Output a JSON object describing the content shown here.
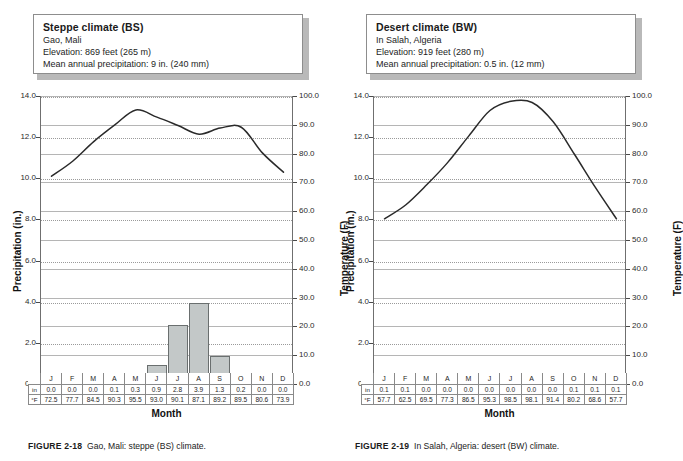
{
  "figures": [
    {
      "id": "gao-mali",
      "info": {
        "title": "Steppe climate (BS)",
        "location": "Gao, Mali",
        "elevation": "Elevation: 869 feet (265 m)",
        "precipitation": "Mean annual precipitation: 9 in. (240 mm)"
      },
      "caption_label": "FIGURE 2-18",
      "caption_text": "Gao, Mali: steppe (BS) climate.",
      "chart_data": {
        "type": "bar",
        "title": "Steppe climate (BS)",
        "categories": [
          "J",
          "F",
          "M",
          "A",
          "M",
          "J",
          "J",
          "A",
          "S",
          "O",
          "N",
          "D"
        ],
        "xlabel": "Month",
        "ylabel": "Precipitation (in.)",
        "ylabel_right": "Temperature (F)",
        "ylim": [
          0.0,
          14.0
        ],
        "ylim_right": [
          0.0,
          100.0
        ],
        "yticks": [
          "0.0",
          "2.0",
          "4.0",
          "6.0",
          "8.0",
          "10.0",
          "12.0",
          "14.0"
        ],
        "yticks_right": [
          "0.0",
          "10.0",
          "20.0",
          "30.0",
          "40.0",
          "50.0",
          "60.0",
          "70.0",
          "80.0",
          "90.0",
          "100.0"
        ],
        "grid": true,
        "legend": "none",
        "series": [
          {
            "name": "in",
            "type": "bar",
            "values": [
              0.0,
              0.0,
              0.0,
              0.1,
              0.3,
              0.9,
              2.8,
              3.9,
              1.3,
              0.2,
              0.0,
              0.0
            ]
          },
          {
            "name": "°F",
            "type": "line",
            "values": [
              72.5,
              77.7,
              84.5,
              90.3,
              95.5,
              93.0,
              90.1,
              87.1,
              89.2,
              89.5,
              80.6,
              73.9
            ]
          }
        ]
      },
      "table": {
        "row_labels": [
          "in",
          "°F"
        ],
        "months": [
          "J",
          "F",
          "M",
          "A",
          "M",
          "J",
          "J",
          "A",
          "S",
          "O",
          "N",
          "D"
        ],
        "precip": [
          "0.0",
          "0.0",
          "0.0",
          "0.1",
          "0.3",
          "0.9",
          "2.8",
          "3.9",
          "1.3",
          "0.2",
          "0.0",
          "0.0"
        ],
        "temp": [
          "72.5",
          "77.7",
          "84.5",
          "90.3",
          "95.5",
          "93.0",
          "90.1",
          "87.1",
          "89.2",
          "89.5",
          "80.6",
          "73.9"
        ]
      }
    },
    {
      "id": "in-salah-algeria",
      "info": {
        "title": "Desert climate (BW)",
        "location": "In Salah, Algeria",
        "elevation": "Elevation: 919 feet (280 m)",
        "precipitation": "Mean annual precipitation: 0.5 in. (12 mm)"
      },
      "caption_label": "FIGURE 2-19",
      "caption_text": "In Salah, Algeria: desert (BW) climate.",
      "chart_data": {
        "type": "bar",
        "title": "Desert climate (BW)",
        "categories": [
          "J",
          "F",
          "M",
          "A",
          "M",
          "J",
          "J",
          "A",
          "S",
          "O",
          "N",
          "D"
        ],
        "xlabel": "Month",
        "ylabel": "Precipitation (in.)",
        "ylabel_right": "Temperature (F)",
        "ylim": [
          0.0,
          14.0
        ],
        "ylim_right": [
          0.0,
          100.0
        ],
        "yticks": [
          "0.0",
          "2.0",
          "4.0",
          "6.0",
          "8.0",
          "10.0",
          "12.0",
          "14.0"
        ],
        "yticks_right": [
          "0.0",
          "10.0",
          "20.0",
          "30.0",
          "40.0",
          "50.0",
          "60.0",
          "70.0",
          "80.0",
          "90.0",
          "100.0"
        ],
        "grid": true,
        "legend": "none",
        "series": [
          {
            "name": "in",
            "type": "bar",
            "values": [
              0.1,
              0.1,
              0.0,
              0.0,
              0.0,
              0.0,
              0.0,
              0.0,
              0.0,
              0.1,
              0.1,
              0.1
            ]
          },
          {
            "name": "°F",
            "type": "line",
            "values": [
              57.7,
              62.5,
              69.5,
              77.3,
              86.5,
              95.3,
              98.5,
              98.1,
              91.4,
              80.2,
              68.6,
              57.7
            ]
          }
        ]
      },
      "table": {
        "row_labels": [
          "in",
          "°F"
        ],
        "months": [
          "J",
          "F",
          "M",
          "A",
          "M",
          "J",
          "J",
          "A",
          "S",
          "O",
          "N",
          "D"
        ],
        "precip": [
          "0.1",
          "0.1",
          "0.0",
          "0.0",
          "0.0",
          "0.0",
          "0.0",
          "0.0",
          "0.0",
          "0.1",
          "0.1",
          "0.1"
        ],
        "temp": [
          "57.7",
          "62.5",
          "69.5",
          "77.3",
          "86.5",
          "95.3",
          "98.5",
          "98.1",
          "91.4",
          "80.2",
          "68.6",
          "57.7"
        ]
      }
    }
  ]
}
